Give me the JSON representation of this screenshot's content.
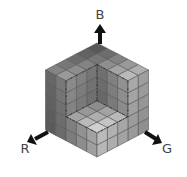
{
  "diagram": {
    "axes": [
      {
        "key": "B",
        "label": "B",
        "direction": "up"
      },
      {
        "key": "R",
        "label": "R",
        "direction": "down-left"
      },
      {
        "key": "G",
        "label": "G",
        "direction": "down-right"
      }
    ],
    "grid_cells_per_edge": 5,
    "cutout_cells": 3,
    "colors": {
      "background": "#ffffff",
      "arrow": "#111111",
      "grid_line": "#555555",
      "cut_edge": "#333333"
    }
  }
}
